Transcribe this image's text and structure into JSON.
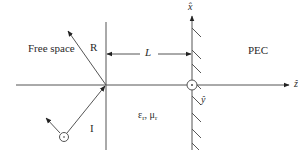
{
  "diagram": {
    "regions": {
      "free_space": "Free space",
      "medium": {
        "eps": "ε",
        "eps_sub": "r",
        "sep": ", ",
        "mu": "μ",
        "mu_sub": "r"
      },
      "pec": "PEC"
    },
    "rays": {
      "incident": "I",
      "reflected": "R"
    },
    "dimension": {
      "label": "L"
    },
    "axes": {
      "x": "x̂",
      "y": "ŷ",
      "z": "ẑ"
    },
    "colors": {
      "line": "#555555",
      "text": "#2a2a2a",
      "background": "#ffffff"
    }
  }
}
